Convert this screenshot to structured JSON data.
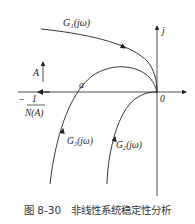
{
  "figure": {
    "caption": "图 8-30　非线性系统稳定性分析",
    "labels": {
      "g1": "G₁(jω)",
      "g2": "G₂(jω)",
      "g3": "G₃(jω)",
      "imag_axis": "j",
      "origin": "0",
      "point_a": "a",
      "amplitude": "A",
      "neg_inv_num": "1",
      "neg_inv_den": "N(A)",
      "neg_sign": "−"
    }
  }
}
